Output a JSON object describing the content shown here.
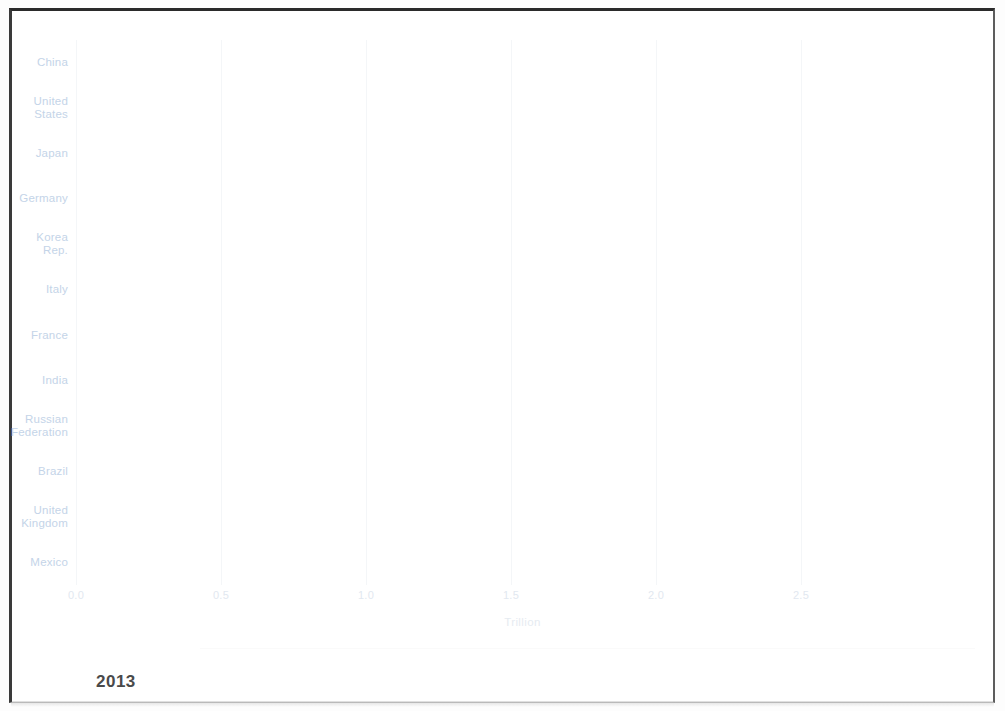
{
  "chart_data": {
    "type": "bar",
    "orientation": "horizontal",
    "title": "",
    "subtitle": "",
    "xlabel": "Trillion",
    "ylabel": "",
    "xlim": [
      0.0,
      3.0
    ],
    "xticks": [
      "0.0",
      "0.5",
      "1.0",
      "1.5",
      "2.0",
      "2.5"
    ],
    "xtick_values": [
      0.0,
      0.5,
      1.0,
      1.5,
      2.0,
      2.5
    ],
    "grid": true,
    "legend": false,
    "bar_color": "#7ba7e0",
    "categories": [
      "China",
      "United\nStates",
      "Japan",
      "Germany",
      "Korea\nRep.",
      "Italy",
      "France",
      "India",
      "Russian\nFederation",
      "Brazil",
      "United\nKingdom",
      "Mexico"
    ],
    "values": [
      3.02,
      2.07,
      1.04,
      0.79,
      0.39,
      0.32,
      0.32,
      0.32,
      0.28,
      0.28,
      0.28,
      0.23
    ],
    "annotations": [
      {
        "name": "year",
        "text": "2013"
      }
    ]
  },
  "axis": {
    "x_title": "Trillion"
  },
  "footer": {
    "year": "2013",
    "ghost_text": ""
  }
}
